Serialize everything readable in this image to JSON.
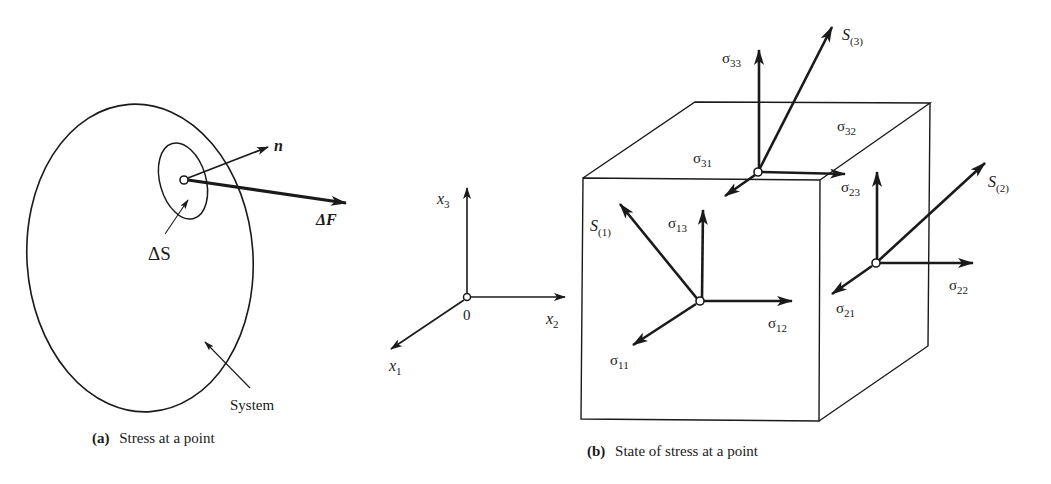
{
  "panel_a": {
    "caption_tag": "(a)",
    "caption_text": "Stress at a point",
    "normal_label": "n",
    "force_label": "ΔF",
    "area_label": "ΔS",
    "system_label": "System"
  },
  "panel_b": {
    "caption_tag": "(b)",
    "caption_text": "State of stress at a point",
    "axes": {
      "x1": {
        "base": "x",
        "sub": "1"
      },
      "x2": {
        "base": "x",
        "sub": "2"
      },
      "x3": {
        "base": "x",
        "sub": "3"
      },
      "origin": "0"
    },
    "face3": {
      "traction": {
        "base": "S",
        "sub": "(3)"
      },
      "s33": {
        "base": "σ",
        "sub": "33"
      },
      "s32": {
        "base": "σ",
        "sub": "32"
      },
      "s31": {
        "base": "σ",
        "sub": "31"
      }
    },
    "face1": {
      "traction": {
        "base": "S",
        "sub": "(1)"
      },
      "s13": {
        "base": "σ",
        "sub": "13"
      },
      "s12": {
        "base": "σ",
        "sub": "12"
      },
      "s11": {
        "base": "σ",
        "sub": "11"
      }
    },
    "face2": {
      "traction": {
        "base": "S",
        "sub": "(2)"
      },
      "s23": {
        "base": "σ",
        "sub": "23"
      },
      "s22": {
        "base": "σ",
        "sub": "22"
      },
      "s21": {
        "base": "σ",
        "sub": "21"
      }
    }
  },
  "colors": {
    "ink": "#1a1a1a",
    "background": "#ffffff"
  }
}
